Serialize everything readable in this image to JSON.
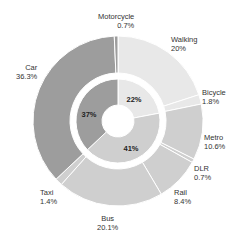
{
  "chart_data": {
    "type": "pie",
    "subtype": "nested-donut",
    "title": "",
    "outer_ring": {
      "categories": [
        "Walking",
        "Bicycle",
        "Metro",
        "DLR",
        "Rail",
        "Bus",
        "Taxi",
        "Car",
        "Motorcycle"
      ],
      "values": [
        20,
        1.8,
        10.6,
        0.7,
        8.4,
        20.1,
        1.4,
        36.3,
        0.7
      ],
      "labels": [
        "20%",
        "1.8%",
        "10.6%",
        "0.7%",
        "8.4%",
        "20.1%",
        "1.4%",
        "36.3%",
        "0.7%"
      ],
      "groups": [
        0,
        0,
        1,
        1,
        1,
        1,
        1,
        2,
        2
      ]
    },
    "inner_ring": {
      "categories": [
        "Active travel",
        "Public transport",
        "Private vehicle"
      ],
      "values": [
        22,
        41,
        37
      ],
      "labels": [
        "22%",
        "41%",
        "37%"
      ]
    },
    "colors": {
      "group_0": "#e8e8e8",
      "group_1": "#cfcfcf",
      "group_2": "#9d9d9d",
      "separator": "#ffffff"
    },
    "start_angle_deg": 0,
    "direction": "clockwise",
    "legend": "none"
  },
  "labels": {
    "walking": {
      "name": "Walking",
      "value": "20%"
    },
    "bicycle": {
      "name": "Bicycle",
      "value": "1.8%"
    },
    "metro": {
      "name": "Metro",
      "value": "10.6%"
    },
    "dlr": {
      "name": "DLR",
      "value": "0.7%"
    },
    "rail": {
      "name": "Rail",
      "value": "8.4%"
    },
    "bus": {
      "name": "Bus",
      "value": "20.1%"
    },
    "taxi": {
      "name": "Taxi",
      "value": "1.4%"
    },
    "car": {
      "name": "Car",
      "value": "36.3%"
    },
    "motorcycle": {
      "name": "Motorcycle",
      "value": "0.7%"
    }
  },
  "inner_labels": {
    "active": "22%",
    "public": "41%",
    "private": "37%"
  }
}
